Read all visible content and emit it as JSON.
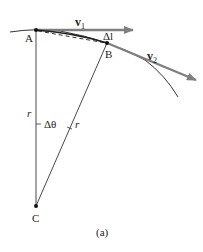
{
  "diagram": {
    "caption": "(a)",
    "points": {
      "A": "A",
      "B": "B",
      "C": "C"
    },
    "vectors": {
      "v1_main": "v",
      "v1_sub": "1",
      "v2_main": "v",
      "v2_sub": "2"
    },
    "labels": {
      "delta_l": "Δl",
      "delta_theta": "Δθ",
      "r_left": "r",
      "r_right": "r"
    },
    "colors": {
      "arrow": "#7f7f7f",
      "line": "#333333"
    }
  }
}
